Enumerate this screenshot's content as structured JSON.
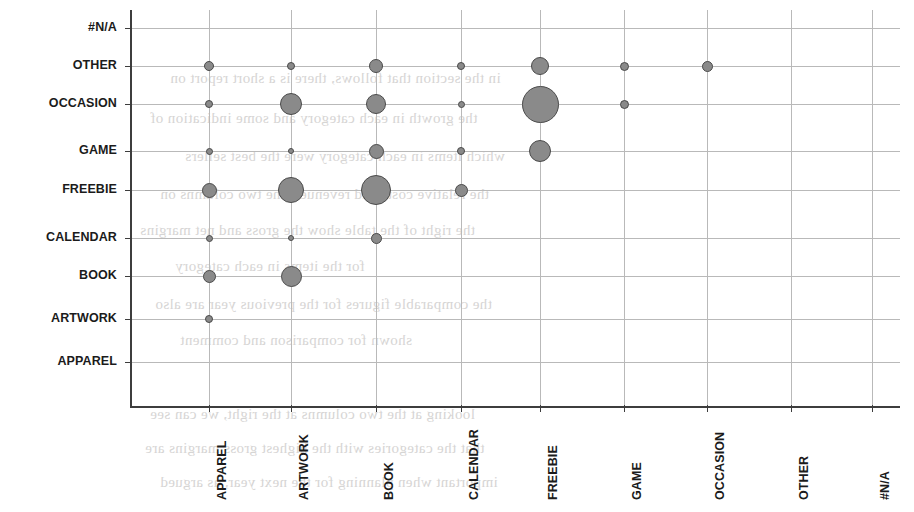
{
  "chart_data": {
    "type": "scatter",
    "title": "",
    "subtitle": "",
    "xlabel": "",
    "ylabel": "",
    "legend": null,
    "grid": true,
    "bubble_color": "#8a8a8a",
    "bubble_border_color": "#4a4a4a",
    "axis_color": "#3d3d3d",
    "gridline_color": "#b9b9b9",
    "x_categories": [
      "APPAREL",
      "ARTWORK",
      "BOOK",
      "CALENDAR",
      "FREEBIE",
      "GAME",
      "OCCASION",
      "OTHER",
      "#N/A"
    ],
    "y_categories": [
      "APPAREL",
      "ARTWORK",
      "BOOK",
      "CALENDAR",
      "FREEBIE",
      "GAME",
      "OCCASION",
      "OTHER",
      "#N/A"
    ],
    "x_tick_labels": [
      "APPAREL",
      "ARTWORK",
      "BOOK",
      "CALENDAR",
      "FREEBIE",
      "GAME",
      "OCCASION",
      "OTHER",
      "#N/A"
    ],
    "y_tick_labels_top_to_bottom": [
      "#N/A",
      "OTHER",
      "OCCASION",
      "GAME",
      "FREEBIE",
      "CALENDAR",
      "BOOK",
      "ARTWORK",
      "APPAREL"
    ],
    "xlim": [
      "APPAREL",
      "#N/A"
    ],
    "ylim": [
      "APPAREL",
      "#N/A"
    ],
    "points": [
      {
        "x": "APPAREL",
        "y": "OTHER",
        "size": 10
      },
      {
        "x": "APPAREL",
        "y": "OCCASION",
        "size": 8
      },
      {
        "x": "APPAREL",
        "y": "GAME",
        "size": 7
      },
      {
        "x": "APPAREL",
        "y": "FREEBIE",
        "size": 15
      },
      {
        "x": "APPAREL",
        "y": "CALENDAR",
        "size": 7
      },
      {
        "x": "APPAREL",
        "y": "BOOK",
        "size": 13
      },
      {
        "x": "APPAREL",
        "y": "ARTWORK",
        "size": 8
      },
      {
        "x": "ARTWORK",
        "y": "OTHER",
        "size": 8
      },
      {
        "x": "ARTWORK",
        "y": "OCCASION",
        "size": 22
      },
      {
        "x": "ARTWORK",
        "y": "GAME",
        "size": 6
      },
      {
        "x": "ARTWORK",
        "y": "FREEBIE",
        "size": 26
      },
      {
        "x": "ARTWORK",
        "y": "CALENDAR",
        "size": 6
      },
      {
        "x": "ARTWORK",
        "y": "BOOK",
        "size": 21
      },
      {
        "x": "BOOK",
        "y": "OTHER",
        "size": 14
      },
      {
        "x": "BOOK",
        "y": "OCCASION",
        "size": 20
      },
      {
        "x": "BOOK",
        "y": "GAME",
        "size": 15
      },
      {
        "x": "BOOK",
        "y": "FREEBIE",
        "size": 30
      },
      {
        "x": "BOOK",
        "y": "CALENDAR",
        "size": 11
      },
      {
        "x": "CALENDAR",
        "y": "OTHER",
        "size": 8
      },
      {
        "x": "CALENDAR",
        "y": "OCCASION",
        "size": 7
      },
      {
        "x": "CALENDAR",
        "y": "GAME",
        "size": 8
      },
      {
        "x": "CALENDAR",
        "y": "FREEBIE",
        "size": 13
      },
      {
        "x": "FREEBIE",
        "y": "OTHER",
        "size": 18
      },
      {
        "x": "FREEBIE",
        "y": "OCCASION",
        "size": 37
      },
      {
        "x": "FREEBIE",
        "y": "GAME",
        "size": 22
      },
      {
        "x": "GAME",
        "y": "OTHER",
        "size": 9
      },
      {
        "x": "GAME",
        "y": "OCCASION",
        "size": 9
      },
      {
        "x": "OCCASION",
        "y": "OTHER",
        "size": 11
      }
    ]
  },
  "background_ghost_text": {
    "note": "faint mirrored bleed-through from reverse side of the scanned page",
    "lines": [
      "in the section that follows, there is a short report on",
      "the growth in each category and some indication of",
      "which items in each category were the best sellers",
      "the relative costs and revenues. the two columns on",
      "the right of the table show the gross and net margins",
      "for the items in each category",
      "the comparable figures for the previous year are also",
      "shown for comparison and comment",
      "looking at the two columns at the right, we can see",
      "that the categories with the highest gross margins are",
      "important when planning for the next year, as argued"
    ]
  }
}
